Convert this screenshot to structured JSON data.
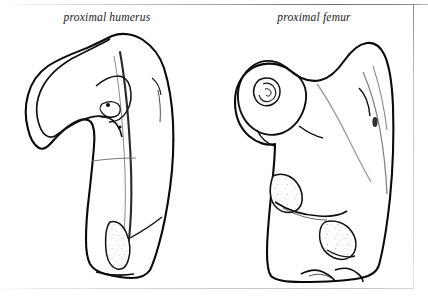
{
  "figure": {
    "title": "",
    "background_color": "#ffffff",
    "ink_color": "#101010",
    "frame": {
      "top_rule": true,
      "right_rule": true,
      "bottom_rule": true,
      "rule_color": "#9a9a9a"
    }
  },
  "captions": {
    "left": "proximal humerus",
    "right": "proximal femur"
  },
  "specimens": [
    {
      "id": "humerus",
      "label": "proximal humerus",
      "view": "anterior",
      "technique": "stipple pen-and-ink line drawing",
      "features": [
        "humeral head",
        "greater tubercle",
        "lesser tubercle",
        "intertubercular (bicipital) groove",
        "anatomical neck",
        "surgical neck",
        "deltoid tuberosity",
        "proximal shaft"
      ]
    },
    {
      "id": "femur",
      "label": "proximal femur",
      "view": "posterior",
      "technique": "stipple pen-and-ink line drawing",
      "features": [
        "femoral head",
        "fovea capitis",
        "femoral neck",
        "greater trochanter",
        "lesser trochanter",
        "intertrochanteric crest",
        "gluteal tuberosity",
        "proximal shaft"
      ]
    }
  ]
}
